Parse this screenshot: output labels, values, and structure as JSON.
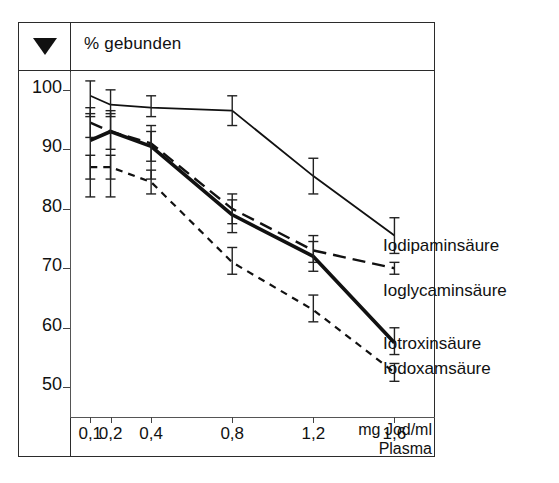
{
  "figure": {
    "header_title": "% gebunden",
    "marker_icon": "triangle-down-icon",
    "x_unit_line1": "mg Jod/ml",
    "x_unit_line2": "Plasma"
  },
  "chart_data": {
    "type": "line",
    "title": "% gebunden",
    "xlabel": "mg Jod/ml Plasma",
    "ylabel": "% gebunden",
    "xlim": [
      0,
      1.8
    ],
    "ylim": [
      45,
      103
    ],
    "grid": false,
    "legend_position": "right-inline",
    "x": [
      0.1,
      0.2,
      0.4,
      0.8,
      1.2,
      1.6
    ],
    "xtick_labels": [
      "0,1",
      "0,2",
      "0,4",
      "0,8",
      "1,2",
      "1,6"
    ],
    "ytick_labels": [
      "100",
      "90",
      "80",
      "70",
      "60",
      "50"
    ],
    "yticks": [
      100,
      90,
      80,
      70,
      60,
      50
    ],
    "series": [
      {
        "name": "Iodipaminsäure",
        "style": "solid-thin",
        "values": [
          99.0,
          97.5,
          97.0,
          96.5,
          85.5,
          75.5
        ],
        "err_low": [
          95.5,
          95.5,
          95.5,
          94.0,
          82.5,
          72.5
        ],
        "err_high": [
          101.5,
          100.0,
          99.0,
          99.0,
          88.5,
          78.5
        ]
      },
      {
        "name": "Ioglycaminsäure",
        "style": "dashed-long",
        "values": [
          94.5,
          93.0,
          91.0,
          80.0,
          73.0,
          70.0
        ],
        "err_low": [
          92.0,
          90.0,
          88.0,
          77.5,
          71.0,
          69.0
        ],
        "err_high": [
          97.0,
          96.0,
          94.0,
          82.5,
          75.5,
          71.0
        ]
      },
      {
        "name": "Iotroxinsäure",
        "style": "solid-thick",
        "values": [
          91.5,
          93.0,
          90.5,
          79.0,
          72.0,
          57.5
        ],
        "err_low": [
          82.0,
          82.0,
          85.0,
          76.0,
          69.5,
          55.5
        ],
        "err_high": [
          96.0,
          96.5,
          93.0,
          81.5,
          74.5,
          60.0
        ]
      },
      {
        "name": "Iodoxamsäure",
        "style": "dashed-short",
        "values": [
          87.0,
          87.0,
          84.5,
          71.0,
          63.0,
          52.5
        ],
        "err_low": [
          85.0,
          85.0,
          82.5,
          69.0,
          61.0,
          51.0
        ],
        "err_high": [
          89.0,
          89.0,
          86.5,
          73.5,
          65.5,
          54.0
        ]
      }
    ],
    "series_label_positions": [
      {
        "name": "Iodipaminsäure",
        "left": 383,
        "top": 236
      },
      {
        "name": "Ioglycaminsäure",
        "left": 383,
        "top": 281
      },
      {
        "name": "Iotroxinsäure",
        "left": 383,
        "top": 334
      },
      {
        "name": "Iodoxamsäure",
        "left": 383,
        "top": 359
      }
    ]
  }
}
